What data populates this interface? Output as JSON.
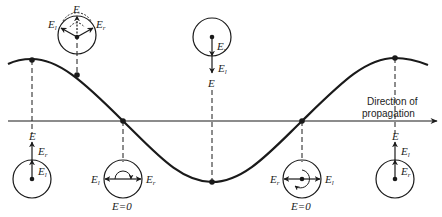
{
  "diagram": {
    "type": "polarization-wave",
    "axis_label_line1": "Direction of",
    "axis_label_line2": "propagation",
    "colors": {
      "ink": "#1a1a1a",
      "background": "#ffffff"
    },
    "symbols": {
      "E": "E",
      "El_base": "E",
      "El_sub": "l",
      "Er_base": "E",
      "Er_sub": "r",
      "E_zero": "E=0"
    },
    "points": [
      {
        "id": "p1",
        "x": 32,
        "phase": "crest",
        "circle": "below",
        "resultant": "E up"
      },
      {
        "id": "p2",
        "x": 77,
        "phase": "intermediate",
        "circle": "above",
        "resultant": "E up, El and Er diverging"
      },
      {
        "id": "p3",
        "x": 123,
        "phase": "node",
        "circle": "below",
        "resultant": "E=0, El left, Er right"
      },
      {
        "id": "p4",
        "x": 212,
        "phase": "trough",
        "circle": "above",
        "resultant": "E down"
      },
      {
        "id": "p5",
        "x": 302,
        "phase": "node",
        "circle": "below",
        "resultant": "E=0, Er left, El right"
      },
      {
        "id": "p6",
        "x": 395,
        "phase": "crest",
        "circle": "below",
        "resultant": "E up"
      }
    ]
  }
}
